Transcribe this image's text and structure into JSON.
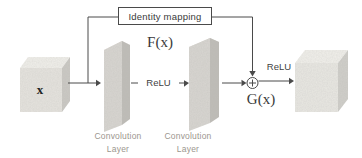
{
  "diagram": {
    "type": "residual-block-diagram",
    "identity_box": {
      "label": "Identity mapping"
    },
    "input_cube": {
      "label": "x"
    },
    "output_cube": {
      "label": ""
    },
    "f_label": "F(x)",
    "g_label": "G(x)",
    "relu_between_layers": "ReLU",
    "relu_output": "ReLU",
    "conv_layers": [
      {
        "line1": "Convolution",
        "line2": "Layer"
      },
      {
        "line1": "Convolution",
        "line2": "Layer"
      }
    ],
    "icons": {
      "sum": "plus-circle-icon"
    },
    "colors": {
      "line": "#4a4a4a",
      "box_border": "#4a4a4a",
      "cube_front": "#e6e4df",
      "cube_top": "#f1f0eb",
      "cube_side": "#cbc9c4",
      "cube_front_out": "#e9e8e3",
      "cube_side_out": "#d0cfca",
      "slab_front": "#d8d6d1",
      "slab_side": "#bfbdb8",
      "slab_top": "#edebe6",
      "label_gray": "#9b968e",
      "text_dark": "#3a3a3a"
    }
  }
}
